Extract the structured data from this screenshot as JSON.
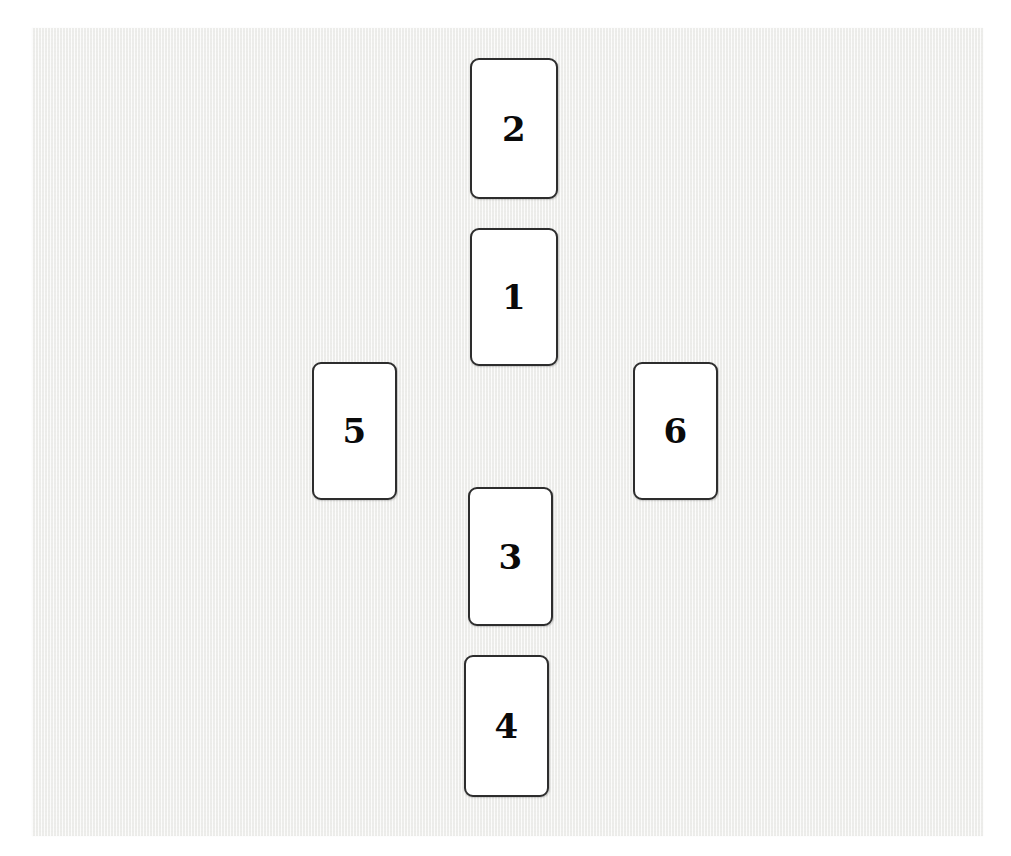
{
  "scene": {
    "description": "Six numbered white cards arranged in a cross layout on a light textured surface",
    "background_color": "#ffffff",
    "surface_color": "#f2f2f0",
    "card_face_color": "#ffffff",
    "card_border_color": "#2d2d2d",
    "label_color": "#0a0a0a",
    "surface": {
      "x": 32,
      "y": 28,
      "width": 951,
      "height": 808
    }
  },
  "cards": [
    {
      "label": "2",
      "name": "card-2",
      "x": 470,
      "y": 58,
      "width": 88,
      "height": 141
    },
    {
      "label": "1",
      "name": "card-1",
      "x": 470,
      "y": 228,
      "width": 88,
      "height": 138
    },
    {
      "label": "5",
      "name": "card-5",
      "x": 312,
      "y": 362,
      "width": 85,
      "height": 138
    },
    {
      "label": "6",
      "name": "card-6",
      "x": 633,
      "y": 362,
      "width": 85,
      "height": 138
    },
    {
      "label": "3",
      "name": "card-3",
      "x": 468,
      "y": 487,
      "width": 85,
      "height": 139
    },
    {
      "label": "4",
      "name": "card-4",
      "x": 464,
      "y": 655,
      "width": 85,
      "height": 142
    }
  ]
}
